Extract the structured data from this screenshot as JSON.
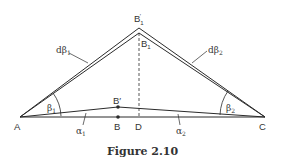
{
  "figure": {
    "caption": "Figure 2.10",
    "colors": {
      "line": "#2b2b2b",
      "text": "#333333",
      "background": "#ffffff"
    },
    "points": {
      "A": {
        "label": "A"
      },
      "B": {
        "label": "B"
      },
      "B_prime": {
        "label": "B′"
      },
      "B1": {
        "label": "B",
        "sub": "1"
      },
      "B1_prime": {
        "label": "B",
        "sub": "1",
        "prime": "′"
      },
      "C": {
        "label": "C"
      },
      "D": {
        "label": "D"
      }
    },
    "angles": {
      "beta1": {
        "label": "β",
        "sub": "1"
      },
      "beta2": {
        "label": "β",
        "sub": "2"
      },
      "alpha1": {
        "label": "α",
        "sub": "1"
      },
      "alpha2": {
        "label": "α",
        "sub": "2"
      },
      "dbeta1": {
        "label": "dβ",
        "sub": "1"
      },
      "dbeta2": {
        "label": "dβ",
        "sub": "2"
      }
    }
  }
}
